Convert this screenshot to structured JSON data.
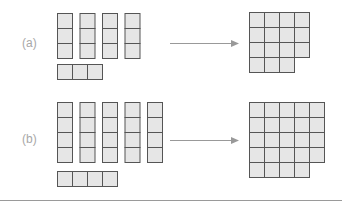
{
  "rows": [
    {
      "label": "(a)",
      "columns": 4,
      "column_height": 3,
      "bar_length": 3,
      "square": {
        "full_rows": 3,
        "cols": 4,
        "last_row_cells": 3
      }
    },
    {
      "label": "(b)",
      "columns": 5,
      "column_height": 4,
      "bar_length": 4,
      "square": {
        "full_rows": 4,
        "cols": 5,
        "last_row_cells": 4
      }
    }
  ],
  "colors": {
    "cell_fill": "#e6e6e6",
    "cell_border": "#555555",
    "arrow": "#999999",
    "label": "#a8a8a8",
    "rule": "#9a9a9a"
  }
}
